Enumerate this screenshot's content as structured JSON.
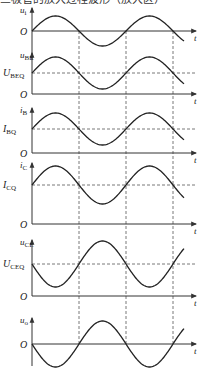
{
  "caption": "三极管的放大过程波形（放大区）",
  "colors": {
    "curve": "#222222",
    "axis": "#333333",
    "dash": "#555555",
    "background": "#ffffff"
  },
  "time_axis_label": "t",
  "panels": [
    {
      "id": "ui",
      "ylabel_main": "u",
      "ylabel_sub": "i",
      "origin_label": "O",
      "q_label_main": "",
      "q_label_sub": "",
      "phase": "in-phase",
      "description": "input voltage"
    },
    {
      "id": "ube",
      "ylabel_main": "u",
      "ylabel_sub": "BE",
      "origin_label": "O",
      "q_label_main": "U",
      "q_label_sub": "BEQ",
      "phase": "in-phase",
      "description": "base-emitter voltage"
    },
    {
      "id": "ib",
      "ylabel_main": "i",
      "ylabel_sub": "B",
      "origin_label": "O",
      "q_label_main": "I",
      "q_label_sub": "BQ",
      "phase": "in-phase",
      "description": "base current"
    },
    {
      "id": "ic",
      "ylabel_main": "i",
      "ylabel_sub": "C",
      "origin_label": "O",
      "q_label_main": "I",
      "q_label_sub": "CQ",
      "phase": "in-phase",
      "description": "collector current"
    },
    {
      "id": "uce",
      "ylabel_main": "u",
      "ylabel_sub": "CE",
      "origin_label": "O",
      "q_label_main": "U",
      "q_label_sub": "CEQ",
      "phase": "inverted",
      "description": "collector-emitter voltage"
    },
    {
      "id": "uo",
      "ylabel_main": "u",
      "ylabel_sub": "o",
      "origin_label": "O",
      "q_label_main": "",
      "q_label_sub": "",
      "phase": "inverted",
      "description": "output voltage"
    }
  ],
  "chart_data": {
    "type": "line",
    "xlabel": "t",
    "x_cycles": 1.6,
    "series": [
      {
        "name": "u_i",
        "offset": 0,
        "amplitude": 1,
        "phase_deg": 0
      },
      {
        "name": "u_BE",
        "offset": "U_BEQ",
        "amplitude": 1,
        "phase_deg": 0
      },
      {
        "name": "i_B",
        "offset": "I_BQ",
        "amplitude": 1,
        "phase_deg": 0
      },
      {
        "name": "i_C",
        "offset": "I_CQ",
        "amplitude": 1,
        "phase_deg": 0
      },
      {
        "name": "u_CE",
        "offset": "U_CEQ",
        "amplitude": 1,
        "phase_deg": 180
      },
      {
        "name": "u_o",
        "offset": 0,
        "amplitude": 1.5,
        "phase_deg": 180
      }
    ],
    "dashed_vertical_markers": [
      "T/2",
      "T",
      "3T/2"
    ],
    "grid": false
  }
}
